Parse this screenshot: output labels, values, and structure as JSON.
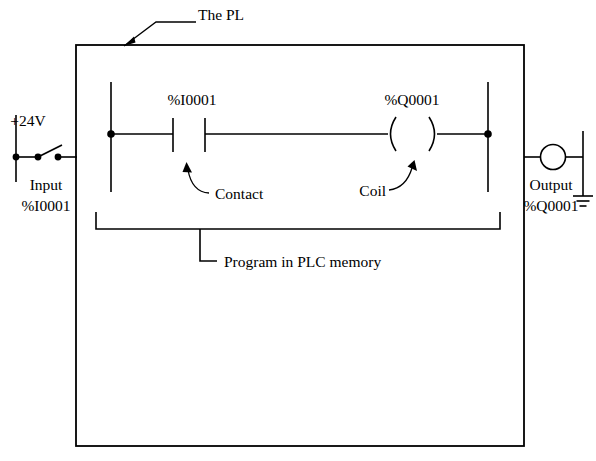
{
  "diagram": {
    "title_annotation": "The PL",
    "labels": {
      "supply": "+24V",
      "input_name": "Input",
      "input_address": "%I0001",
      "contact_address": "%I0001",
      "contact_annotation": "Contact",
      "coil_address": "%Q0001",
      "coil_annotation": "Coil",
      "output_name": "Output",
      "output_address": "%Q0001",
      "program_annotation": "Program in PLC memory"
    },
    "icons": {
      "plc_enclosure": "rectangle-box",
      "input_switch": "normally-open-switch-icon",
      "contact": "ladder-contact-icon",
      "coil": "ladder-coil-icon",
      "output_lamp": "circle-lamp-icon",
      "ground": "earth-ground-icon",
      "pointer_plc": "arrow-icon",
      "pointer_contact": "curved-arrow-icon",
      "pointer_coil": "curved-arrow-icon",
      "program_bracket": "bracket-icon"
    },
    "colors": {
      "line": "#000000",
      "background": "#ffffff",
      "text": "#000000"
    }
  }
}
